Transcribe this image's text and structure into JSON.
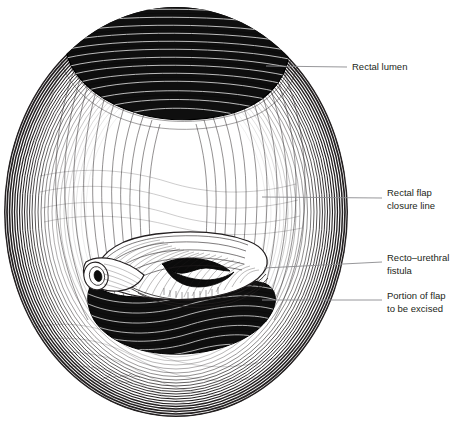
{
  "figure": {
    "medium": "pen-and-ink line drawing",
    "background_color": "#ffffff",
    "ink_color": "#231f20",
    "leader_color": "#8b8b8f",
    "artist_signature": "signature"
  },
  "labels": [
    {
      "id": "rectal-lumen",
      "lines": [
        "Rectal lumen"
      ],
      "text_x": 352,
      "text_y": 67,
      "leader": {
        "x1": 266,
        "y1": 66,
        "x2": 347,
        "y2": 67
      }
    },
    {
      "id": "rectal-flap-closure-line",
      "lines": [
        "Rectal flap",
        "closure line"
      ],
      "text_x": 387,
      "text_y": 198,
      "leader": {
        "x1": 262,
        "y1": 197,
        "x2": 382,
        "y2": 198
      }
    },
    {
      "id": "recto-urethral-fistula",
      "lines": [
        "Recto–urethral",
        "fistula"
      ],
      "text_x": 387,
      "text_y": 262,
      "leader": {
        "x1": 264,
        "y1": 268,
        "x2": 382,
        "y2": 262
      }
    },
    {
      "id": "portion-of-flap-to-be-excised",
      "lines": [
        "Portion of flap",
        "to be excised"
      ],
      "text_x": 387,
      "text_y": 300,
      "leader": {
        "x1": 262,
        "y1": 300,
        "x2": 382,
        "y2": 300
      }
    }
  ],
  "anatomy": {
    "field": {
      "name": "operative field",
      "shape": "oval",
      "center_x": 176,
      "center_y": 212,
      "radius_x": 172,
      "radius_y": 205
    },
    "rectal_lumen": {
      "name": "rectal lumen",
      "description": "dark cavity at top of field with transverse mucosal ridges",
      "center_x": 178,
      "center_y": 62,
      "width": 206,
      "height": 104
    },
    "flap": {
      "name": "rectal advancement flap",
      "description": "lip-shaped mobilized flap crossing the mid field with a dark central slit"
    },
    "fistula_tube": {
      "name": "recto-urethral fistula tract",
      "description": "short cannulated tube at left end of flap with dark lumen opening",
      "center_x": 104,
      "center_y": 277
    },
    "excised_portion": {
      "name": "portion of flap to be excised",
      "description": "dark crescent cavity beneath the flap"
    }
  }
}
